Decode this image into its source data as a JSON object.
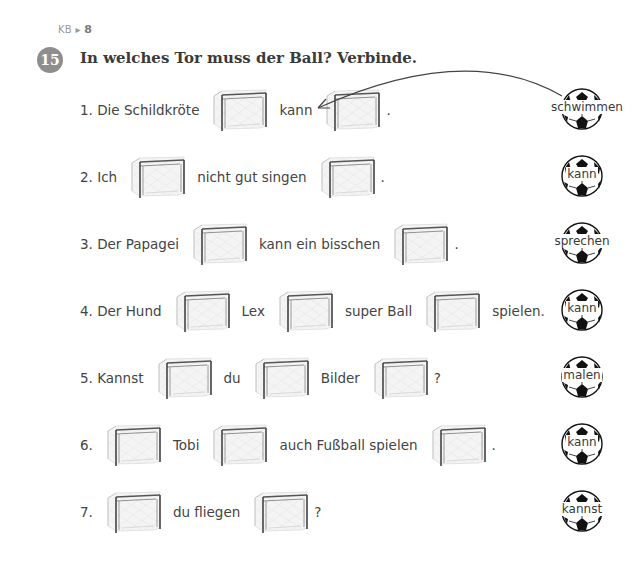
{
  "reference": {
    "prefix": "KB",
    "arrow": "▸",
    "page": "8"
  },
  "exercise": {
    "number": "15",
    "instruction": "In welches Tor muss der Ball? Verbinde."
  },
  "sentences": [
    {
      "id": 1,
      "parts": [
        "1. Die Schildkröte",
        "GOAL",
        "kann",
        "GOAL",
        "."
      ]
    },
    {
      "id": 2,
      "parts": [
        "2. Ich",
        "GOAL",
        "nicht gut singen",
        "GOAL",
        "."
      ]
    },
    {
      "id": 3,
      "parts": [
        "3. Der Papagei",
        "GOAL",
        "kann ein bisschen",
        "GOAL",
        "."
      ]
    },
    {
      "id": 4,
      "parts": [
        "4. Der Hund",
        "GOAL",
        "Lex",
        "GOAL",
        "super Ball",
        "GOAL",
        "spielen."
      ]
    },
    {
      "id": 5,
      "parts": [
        "5. Kannst",
        "GOAL",
        "du",
        "GOAL",
        "Bilder",
        "GOAL",
        "?"
      ]
    },
    {
      "id": 6,
      "parts": [
        "6.",
        "GOAL",
        "Tobi",
        "GOAL",
        "auch Fußball spielen",
        "GOAL",
        "."
      ]
    },
    {
      "id": 7,
      "parts": [
        "7.",
        "GOAL",
        "du fliegen",
        "GOAL",
        "?"
      ]
    }
  ],
  "balls": [
    {
      "word": "schwimmen"
    },
    {
      "word": "kann"
    },
    {
      "word": "sprechen"
    },
    {
      "word": "kann"
    },
    {
      "word": "malen"
    },
    {
      "word": "kann"
    },
    {
      "word": "kannst"
    }
  ],
  "example_connection": {
    "from_ball": "schwimmen",
    "to_sentence": 1,
    "to_goal": 2
  },
  "colors": {
    "badge": "#8e8e8e",
    "text": "#444444",
    "title": "#3a3a3a",
    "reference": "#9a9a9a"
  }
}
